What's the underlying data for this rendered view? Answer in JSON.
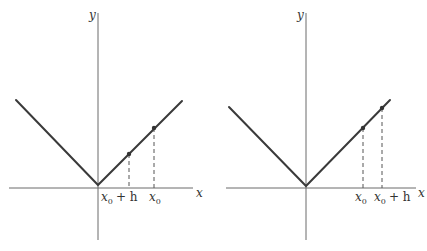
{
  "figure": {
    "colors": {
      "curve": "#3a3a3a",
      "axis": "#6a6a6a",
      "background": "#ffffff"
    },
    "panels": [
      {
        "id": "left",
        "axis_labels": {
          "x": "x",
          "y": "y"
        },
        "points": [
          {
            "label_main": "x",
            "label_sub": "0",
            "label_suffix": "+ h",
            "order": 1
          },
          {
            "label_main": "x",
            "label_sub": "0",
            "label_suffix": "",
            "order": 2
          }
        ]
      },
      {
        "id": "right",
        "axis_labels": {
          "x": "x",
          "y": "y"
        },
        "points": [
          {
            "label_main": "x",
            "label_sub": "0",
            "label_suffix": "",
            "order": 1
          },
          {
            "label_main": "x",
            "label_sub": "0",
            "label_suffix": "+ h",
            "order": 2
          }
        ]
      }
    ]
  }
}
